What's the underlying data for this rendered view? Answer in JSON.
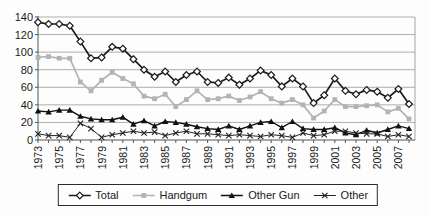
{
  "chart_data": {
    "type": "line",
    "title": "",
    "xlabel": "",
    "ylabel": "",
    "ylim": [
      0,
      140
    ],
    "yticks": [
      0,
      20,
      40,
      60,
      80,
      100,
      120,
      140
    ],
    "grid": true,
    "legend_position": "bottom-center",
    "x": [
      1973,
      1974,
      1975,
      1976,
      1977,
      1978,
      1979,
      1980,
      1981,
      1982,
      1983,
      1984,
      1985,
      1986,
      1987,
      1988,
      1989,
      1990,
      1991,
      1992,
      1993,
      1994,
      1995,
      1996,
      1997,
      1998,
      1999,
      2000,
      2001,
      2002,
      2003,
      2004,
      2005,
      2006,
      2007,
      2008
    ],
    "x_tick_labels": [
      "1973",
      "1975",
      "1977",
      "1979",
      "1981",
      "1983",
      "1985",
      "1987",
      "1989",
      "1991",
      "1993",
      "1995",
      "1997",
      "1999",
      "2001",
      "2003",
      "2005",
      "2007"
    ],
    "series": [
      {
        "name": "Total",
        "marker": "diamond-open",
        "color": "#1a1a1a",
        "line_width": 1.7,
        "values": [
          134,
          132,
          132,
          130,
          112,
          93,
          94,
          106,
          104,
          92,
          80,
          72,
          78,
          66,
          74,
          78,
          66,
          65,
          71,
          63,
          70,
          79,
          74,
          61,
          70,
          61,
          42,
          51,
          70,
          56,
          52,
          57,
          55,
          48,
          58,
          41
        ]
      },
      {
        "name": "Handgum",
        "marker": "square-filled",
        "color": "#b3b3b3",
        "line_width": 1.7,
        "values": [
          94,
          95,
          93,
          93,
          66,
          56,
          68,
          77,
          70,
          64,
          50,
          47,
          52,
          38,
          46,
          56,
          46,
          47,
          50,
          45,
          49,
          55,
          47,
          42,
          46,
          40,
          25,
          33,
          46,
          38,
          38,
          39,
          40,
          32,
          36,
          24
        ]
      },
      {
        "name": "Other Gun",
        "marker": "triangle-filled",
        "color": "#111111",
        "line_width": 1.4,
        "values": [
          33,
          32,
          34,
          34,
          27,
          24,
          23,
          23,
          26,
          18,
          22,
          16,
          21,
          20,
          18,
          15,
          13,
          12,
          16,
          12,
          16,
          20,
          21,
          14,
          21,
          13,
          12,
          12,
          14,
          8,
          6,
          11,
          8,
          12,
          16,
          13
        ]
      },
      {
        "name": "Other",
        "marker": "x",
        "color": "#222222",
        "line_width": 1.0,
        "values": [
          7,
          5,
          5,
          3,
          19,
          13,
          3,
          6,
          8,
          10,
          8,
          9,
          5,
          8,
          10,
          7,
          7,
          6,
          5,
          6,
          5,
          4,
          6,
          5,
          3,
          8,
          5,
          6,
          10,
          10,
          8,
          7,
          7,
          4,
          6,
          4
        ]
      }
    ],
    "colors": {
      "gridline": "#999999",
      "axis": "#555555",
      "background": "#fdfdfd"
    }
  },
  "legend": {
    "items": [
      "Total",
      "Handgum",
      "Other Gun",
      "Other"
    ]
  }
}
